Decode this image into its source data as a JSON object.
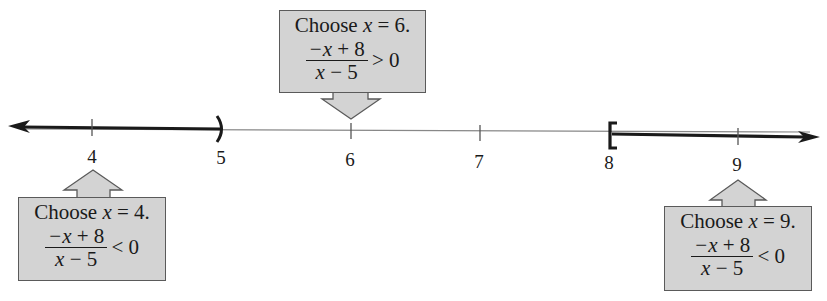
{
  "number_line": {
    "variable": "x",
    "ticks": [
      {
        "value": "4",
        "label": "4"
      },
      {
        "value": "5",
        "label": "5"
      },
      {
        "value": "6",
        "label": "6"
      },
      {
        "value": "7",
        "label": "7"
      },
      {
        "value": "8",
        "label": "8"
      },
      {
        "value": "9",
        "label": "9"
      }
    ],
    "shaded_intervals": [
      {
        "from": "-infinity",
        "to": "5",
        "right_endpoint": "open parenthesis"
      },
      {
        "from": "8",
        "to": "infinity",
        "left_endpoint": "closed bracket"
      }
    ]
  },
  "callouts": [
    {
      "id": "test-4",
      "title_prefix": "Choose ",
      "var": "x",
      "title_suffix": " = 4.",
      "numerator_var": "−x",
      "numerator_rest": " + 8",
      "denominator_var": "x",
      "denominator_rest": " − 5",
      "relation": "< 0",
      "arrow": "up"
    },
    {
      "id": "test-6",
      "title_prefix": "Choose ",
      "var": "x",
      "title_suffix": " = 6.",
      "numerator_var": "−x",
      "numerator_rest": " + 8",
      "denominator_var": "x",
      "denominator_rest": " − 5",
      "relation": "> 0",
      "arrow": "down"
    },
    {
      "id": "test-9",
      "title_prefix": "Choose ",
      "var": "x",
      "title_suffix": " = 9.",
      "numerator_var": "−x",
      "numerator_rest": " + 8",
      "denominator_var": "x",
      "denominator_rest": " − 5",
      "relation": "< 0",
      "arrow": "up"
    }
  ],
  "colors": {
    "box_fill": "#d3d3d3",
    "box_border": "#5a5a5a",
    "line": "#1a1a1a",
    "thin_line": "#777777"
  }
}
